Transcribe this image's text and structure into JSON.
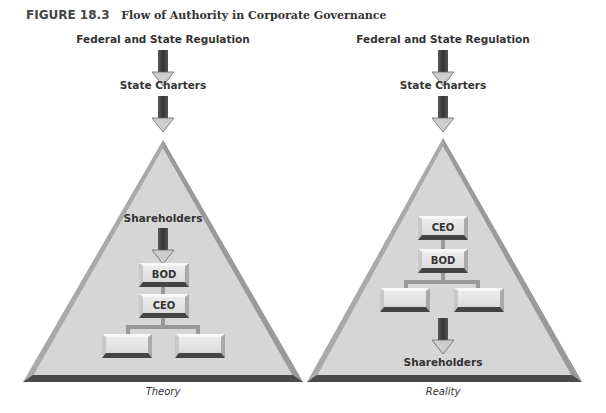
{
  "figure": {
    "number": "FIGURE 18.3",
    "title": "Flow of Authority in Corporate Governance"
  },
  "panels": [
    {
      "caption": "Theory",
      "top_labels": [
        "Federal and State Regulation",
        "State Charters"
      ],
      "inner_label": "Shareholders",
      "boxes": [
        "BOD",
        "CEO",
        "",
        ""
      ]
    },
    {
      "caption": "Reality",
      "top_labels": [
        "Federal and State Regulation",
        "State Charters"
      ],
      "inner_label": "Shareholders",
      "boxes": [
        "CEO",
        "BOD",
        "",
        ""
      ]
    }
  ],
  "colors": {
    "triangle_fill": "#d4d4d4",
    "triangle_edge": "#a8a8a8",
    "triangle_base": "#555555",
    "box_fill": "#e2e2e2",
    "box_shadow": "#444444",
    "arrow_dark": "#3a3a3a",
    "arrow_light": "#cfcfcf"
  }
}
